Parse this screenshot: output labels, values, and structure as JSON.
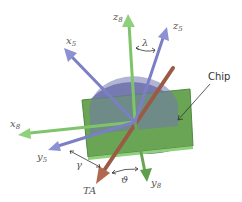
{
  "figure": {
    "axes": {
      "z8": {
        "label": "z",
        "sub": "8"
      },
      "z5": {
        "label": "z",
        "sub": "5"
      },
      "x5": {
        "label": "x",
        "sub": "5"
      },
      "x8": {
        "label": "x",
        "sub": "8"
      },
      "y5": {
        "label": "y",
        "sub": "5"
      },
      "y8": {
        "label": "y",
        "sub": "8"
      },
      "ta": {
        "label": "TA"
      }
    },
    "angles": {
      "lambda": "λ",
      "gamma": "γ",
      "theta": "ϑ"
    },
    "chip_label": "Chip",
    "colors": {
      "green_axis": "#7fc46a",
      "blue_axis": "#7b7fc4",
      "brown_rod": "#9a5a43",
      "chip": "#6aa455",
      "disk": "#6e71a8"
    }
  }
}
